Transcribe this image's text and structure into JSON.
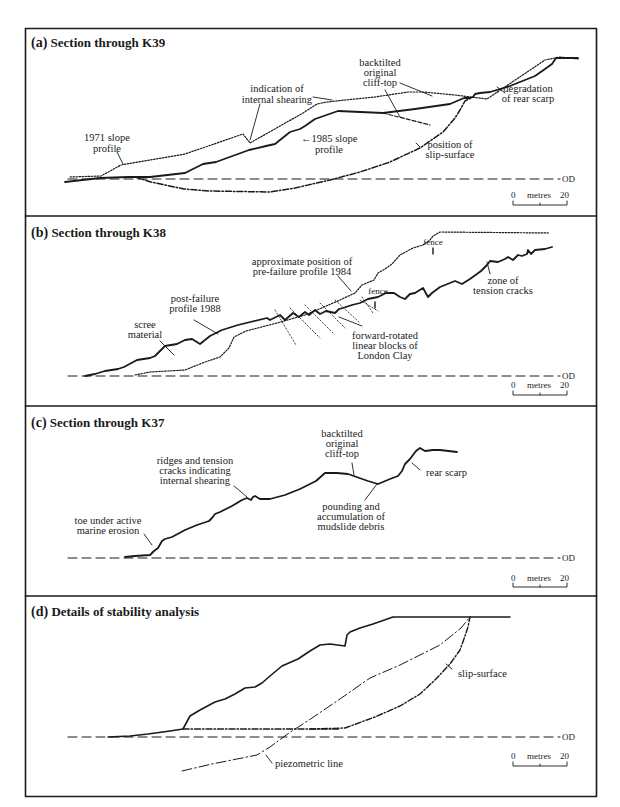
{
  "panels": [
    {
      "id": "a",
      "letter": "(a)",
      "title": "Section through K39",
      "annotations": {
        "profile_1971": [
          "1971 slope",
          "profile"
        ],
        "internal_shearing": [
          "indication of",
          "internal shearing"
        ],
        "profile_1985": [
          "←1985 slope",
          "profile"
        ],
        "cliff_top": [
          "backtilted",
          "original",
          "cliff-top"
        ],
        "slip_surface": [
          "position of",
          "slip-surface"
        ],
        "rear_scarp": [
          "degradation",
          "of rear scarp"
        ]
      },
      "od_label": "OD",
      "scale": {
        "start": "0",
        "unit": "metres",
        "end": "20"
      }
    },
    {
      "id": "b",
      "letter": "(b)",
      "title": "Section through K38",
      "annotations": {
        "pre_failure": [
          "approximate position of",
          "pre-failure profile 1984"
        ],
        "post_failure": [
          "post-failure",
          "profile 1988"
        ],
        "scree": [
          "scree",
          "material"
        ],
        "fence_top": "fence",
        "fence_mid": "fence",
        "tension_cracks": [
          "zone of",
          "tension cracks"
        ],
        "blocks": [
          "forward-rotated",
          "linear blocks of",
          "London Clay"
        ]
      },
      "od_label": "OD",
      "scale": {
        "start": "0",
        "unit": "metres",
        "end": "20"
      }
    },
    {
      "id": "c",
      "letter": "(c)",
      "title": "Section through K37",
      "annotations": {
        "ridges": [
          "ridges and tension",
          "cracks indicating",
          "internal shearing"
        ],
        "cliff_top": [
          "backtilted",
          "original",
          "cliff-top"
        ],
        "rear_scarp": "rear scarp",
        "toe": [
          "toe under active",
          "marine erosion"
        ],
        "pounding": [
          "pounding and",
          "accumulation of",
          "mudslide debris"
        ]
      },
      "od_label": "OD",
      "scale": {
        "start": "0",
        "unit": "metres",
        "end": "20"
      }
    },
    {
      "id": "d",
      "letter": "(d)",
      "title": "Details of stability analysis",
      "annotations": {
        "slip_surface": "slip-surface",
        "piezometric": "piezometric line"
      },
      "od_label": "OD",
      "scale": {
        "start": "0",
        "unit": "metres",
        "end": "20"
      }
    }
  ]
}
